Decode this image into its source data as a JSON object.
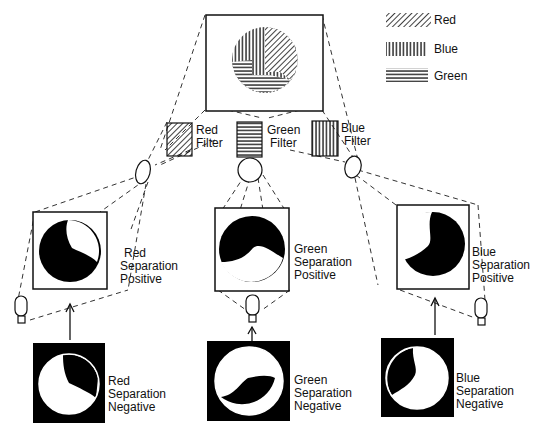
{
  "legend": [
    {
      "label": "Red",
      "pattern": "diagonal-hatch"
    },
    {
      "label": "Blue",
      "pattern": "vertical-hatch"
    },
    {
      "label": "Green",
      "pattern": "horizontal-hatch"
    }
  ],
  "original": {
    "label": "",
    "segments": [
      "Red",
      "Blue",
      "Green"
    ]
  },
  "filters": [
    {
      "line1": "Red",
      "line2": "Filter",
      "pattern": "diagonal-hatch"
    },
    {
      "line1": "Green",
      "line2": "Filter",
      "pattern": "horizontal-hatch"
    },
    {
      "line1": "Blue",
      "line2": "Filter",
      "pattern": "vertical-hatch"
    }
  ],
  "positives": [
    {
      "line1": "Red",
      "line2": "Separation",
      "line3": "Positive"
    },
    {
      "line1": "Green",
      "line2": "Separation",
      "line3": "Positive"
    },
    {
      "line1": "Blue",
      "line2": "Separation",
      "line3": "Positive"
    }
  ],
  "negatives": [
    {
      "line1": "Red",
      "line2": "Separation",
      "line3": "Negative"
    },
    {
      "line1": "Green",
      "line2": "Separation",
      "line3": "Negative"
    },
    {
      "line1": "Blue",
      "line2": "Separation",
      "line3": "Negative"
    }
  ]
}
